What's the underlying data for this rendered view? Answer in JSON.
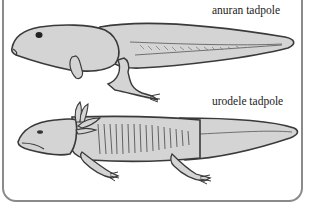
{
  "diagram": {
    "labels": {
      "anuran": "anuran tadpole",
      "urodele": "urodele tadpole"
    },
    "colors": {
      "body_fill": "#d4d4d4",
      "outline": "#3a3a3a",
      "frame": "#8a8a8a",
      "background": "#ffffff"
    }
  }
}
